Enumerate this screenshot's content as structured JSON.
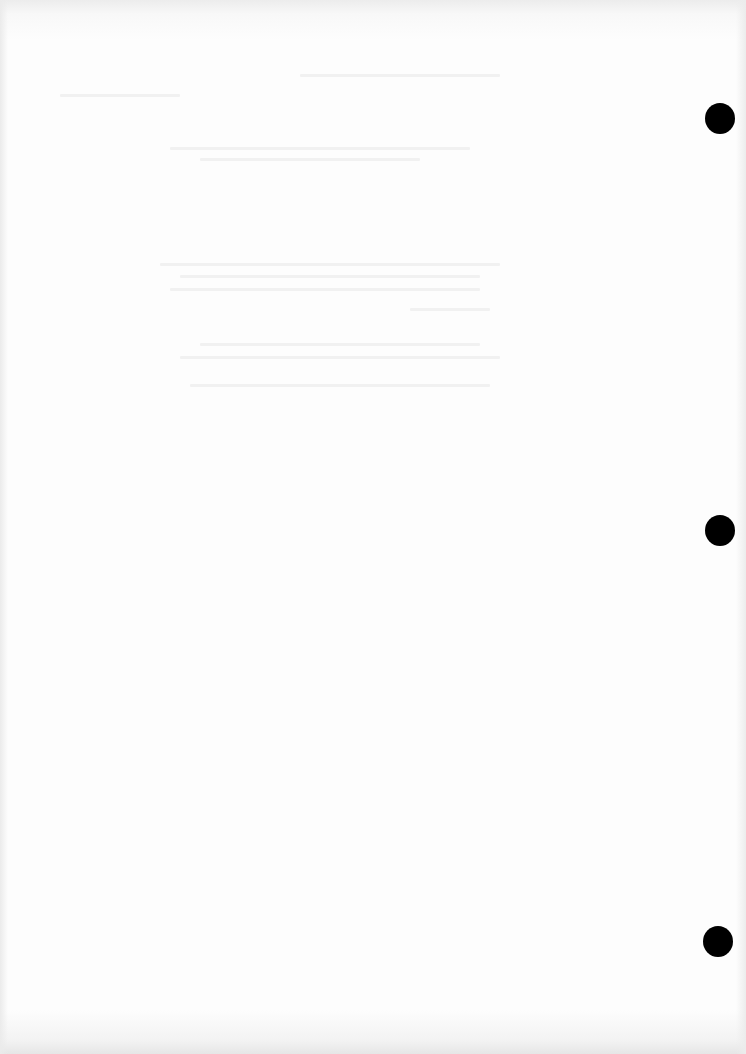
{
  "document": {
    "type": "blank-scanned-page",
    "background_color": "#fdfdfd",
    "punch_holes": [
      {
        "cx": 720,
        "cy": 118
      },
      {
        "cx": 720,
        "cy": 530
      },
      {
        "cx": 718,
        "cy": 941
      }
    ],
    "punch_hole_color": "#000000"
  }
}
